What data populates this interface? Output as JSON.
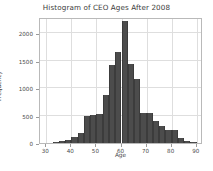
{
  "chart_data": {
    "type": "bar",
    "title": "Histogram of CEO Ages After 2008",
    "xlabel": "Age",
    "ylabel": "Frequency",
    "xlim": [
      27.5,
      92.5
    ],
    "ylim": [
      0,
      2300
    ],
    "xticks": [
      30,
      40,
      50,
      60,
      70,
      80,
      90
    ],
    "yticks": [
      0,
      500,
      1000,
      1500,
      2000
    ],
    "grid": true,
    "legend": null,
    "bar_color": "#4c4c4c",
    "bin_width": 2.5,
    "bin_starts": [
      32.5,
      35.0,
      37.5,
      40.0,
      42.5,
      45.0,
      47.5,
      50.0,
      52.5,
      55.0,
      57.5,
      60.0,
      62.5,
      65.0,
      67.5,
      70.0,
      72.5,
      75.0,
      77.5,
      80.0,
      82.5,
      85.0,
      87.5
    ],
    "categories": [
      "32.5-35",
      "35-37.5",
      "37.5-40",
      "40-42.5",
      "42.5-45",
      "45-47.5",
      "47.5-50",
      "50-52.5",
      "52.5-55",
      "55-57.5",
      "57.5-60",
      "60-62.5",
      "62.5-65",
      "65-67.5",
      "67.5-70",
      "70-72.5",
      "72.5-75",
      "75-77.5",
      "77.5-80",
      "80-82.5",
      "82.5-85",
      "85-87.5",
      "87.5-90"
    ],
    "values": [
      15,
      45,
      50,
      110,
      190,
      495,
      520,
      530,
      880,
      1420,
      1660,
      2230,
      1450,
      1160,
      545,
      540,
      400,
      305,
      240,
      235,
      95,
      40,
      10
    ]
  }
}
